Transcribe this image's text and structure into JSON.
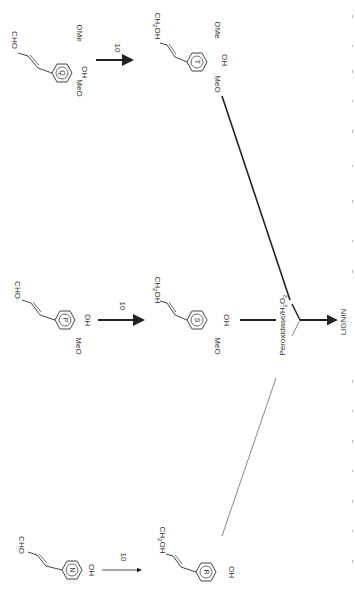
{
  "diagram": {
    "type": "biosynthesis-pathway",
    "orientation": "rotated-90-clockwise",
    "step_label": "10",
    "enzyme_label": "Peroxidase/H2O2",
    "enzyme_parts": {
      "main": "Peroxidase/H",
      "sub1": "2",
      "mid": "O",
      "sub2": "2"
    },
    "product_label": "LIGNIN",
    "rows": [
      {
        "id": "top",
        "aldehyde": {
          "ring_label": "Q",
          "chain": "CHO",
          "substituents": [
            "OMe",
            "OH",
            "MeO"
          ]
        },
        "alcohol": {
          "ring_label": "T",
          "chain": "CH2OH",
          "chain_parts": {
            "a": "CH",
            "sub": "2",
            "b": "OH"
          },
          "substituents": [
            "OMe",
            "OH",
            "MeO"
          ]
        },
        "arrow_weight": "bold"
      },
      {
        "id": "middle",
        "aldehyde": {
          "ring_label": "P",
          "chain": "CHO",
          "substituents": [
            "OH",
            "MeO"
          ]
        },
        "alcohol": {
          "ring_label": "S",
          "chain": "CH2OH",
          "chain_parts": {
            "a": "CH",
            "sub": "2",
            "b": "OH"
          },
          "substituents": [
            "OH",
            "MeO"
          ]
        },
        "arrow_weight": "bold"
      },
      {
        "id": "bottom",
        "aldehyde": {
          "ring_label": "N",
          "chain": "CHO",
          "substituents": [
            "OH"
          ]
        },
        "alcohol": {
          "ring_label": "R",
          "chain": "CH2OH",
          "chain_parts": {
            "a": "CH",
            "sub": "2",
            "b": "OH"
          },
          "substituents": [
            "OH"
          ]
        },
        "arrow_weight": "thin"
      }
    ],
    "colors": {
      "ink": "#222222",
      "background": "#ffffff",
      "faint": "#bbbbbb"
    }
  }
}
